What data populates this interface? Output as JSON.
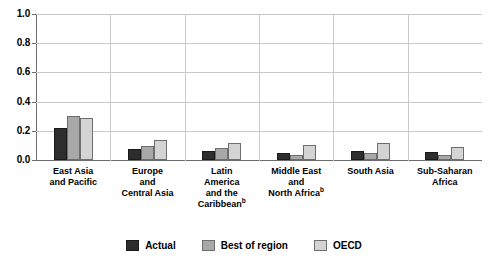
{
  "chart_data": {
    "type": "bar",
    "title": "",
    "xlabel": "",
    "ylabel": "",
    "ylim": [
      0,
      1.0
    ],
    "ytick_labels": [
      "1.0",
      "0.8",
      "0.6",
      "0.4",
      "0.2",
      "0.0"
    ],
    "ytick_values": [
      1.0,
      0.8,
      0.6,
      0.4,
      0.2,
      0.0
    ],
    "grid": "horizontal-and-category-separators",
    "legend_position": "bottom-center",
    "categories": [
      "East Asia and Pacific",
      "Europe and Central Asia",
      "Latin America and the Caribbean",
      "Middle East and North Africa",
      "South Asia",
      "Sub-Saharan Africa"
    ],
    "category_lines": [
      [
        "East Asia",
        "and Pacific"
      ],
      [
        "Europe",
        "and",
        "Central Asia"
      ],
      [
        "Latin",
        "America",
        "and the",
        "Caribbean"
      ],
      [
        "Middle East",
        "and",
        "North Africa"
      ],
      [
        "South Asia"
      ],
      [
        "Sub-Saharan",
        "Africa"
      ]
    ],
    "category_footnotes": [
      null,
      null,
      "b",
      "b",
      null,
      null
    ],
    "series": [
      {
        "name": "Actual",
        "color": "#2d2d2d",
        "values": [
          0.22,
          0.075,
          0.065,
          0.045,
          0.065,
          0.055
        ]
      },
      {
        "name": "Best of region",
        "color": "#a8a8a8",
        "values": [
          0.3,
          0.095,
          0.085,
          0.035,
          0.05,
          0.035
        ]
      },
      {
        "name": "OECD",
        "color": "#d4d4d4",
        "values": [
          0.285,
          0.14,
          0.115,
          0.105,
          0.115,
          0.09
        ]
      }
    ]
  },
  "legend": {
    "items": [
      {
        "label": "Actual",
        "swatch": "series-0"
      },
      {
        "label": "Best of region",
        "swatch": "series-1"
      },
      {
        "label": "OECD",
        "swatch": "series-2"
      }
    ]
  }
}
